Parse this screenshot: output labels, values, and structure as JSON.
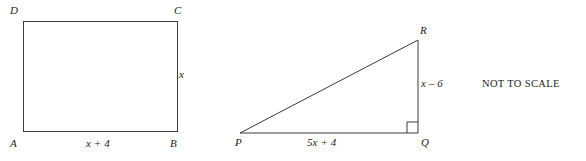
{
  "figure": {
    "note": "NOT TO SCALE",
    "rectangle": {
      "name": "rectangle-abcd",
      "vertices": {
        "top_left": "D",
        "top_right": "C",
        "bottom_left": "A",
        "bottom_right": "B"
      },
      "side_labels": {
        "right": "x",
        "bottom": "x + 4"
      },
      "geometry": {
        "left": 23,
        "top": 21,
        "right": 177,
        "bottom": 131
      }
    },
    "triangle": {
      "name": "right-triangle-pqr",
      "vertices": {
        "bottom_left": "P",
        "bottom_right": "Q",
        "top_right": "R"
      },
      "side_labels": {
        "right": "x – 6",
        "bottom": "5x + 4"
      },
      "right_angle_at": "Q",
      "geometry": {
        "p_x": 240,
        "p_y": 133,
        "q_x": 418,
        "q_y": 133,
        "r_x": 418,
        "r_y": 40,
        "right_angle_marker_size": 11
      }
    },
    "style": {
      "stroke": "#3a3a3a",
      "stroke_width": 1,
      "background": "#ffffff",
      "text_color": "#1c1c1c"
    }
  }
}
